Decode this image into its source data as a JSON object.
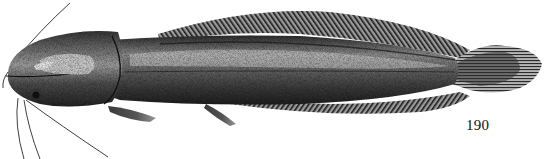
{
  "figure": {
    "style": "stippled black-and-white engraving",
    "figure_number": "190",
    "parts": [
      "barbels",
      "head",
      "eye",
      "pectoral-fin",
      "pelvic-fin",
      "dorsal-fin",
      "anal-fin",
      "caudal-fin",
      "lateral-line"
    ]
  },
  "colors": {
    "background": "#ffffff",
    "ink_dark": "#1a1a1a",
    "ink_mid": "#5a5a5a",
    "ink_light": "#bdbdbd"
  }
}
